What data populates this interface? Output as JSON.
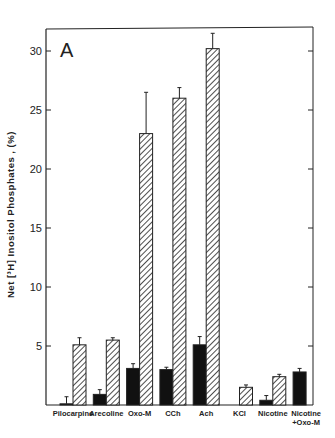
{
  "chart_data": {
    "type": "bar",
    "title": "",
    "panel_label": "A",
    "xlabel": "",
    "ylabel": "Net [3H] Inositol Phosphates , (%)",
    "ylim": [
      0,
      31.5
    ],
    "yticks": [
      5,
      10,
      15,
      20,
      25,
      30
    ],
    "grid": false,
    "legend": null,
    "categories": [
      "Pilocarpine",
      "Arecoline",
      "Oxo-M",
      "CCh",
      "Ach",
      "KCl",
      "Nicotine",
      "Nicotine + Oxo-M"
    ],
    "series": [
      {
        "name": "black (solid)",
        "fill": "#111111",
        "values": [
          0.1,
          0.9,
          3.1,
          3.0,
          5.1,
          0.0,
          0.4,
          2.8
        ],
        "errors": [
          0.6,
          0.4,
          0.4,
          0.2,
          0.7,
          0.0,
          0.4,
          0.3
        ]
      },
      {
        "name": "hatched",
        "fill": "hatch",
        "values": [
          5.1,
          5.5,
          23.0,
          26.0,
          30.2,
          1.5,
          2.4,
          null
        ],
        "errors": [
          0.6,
          0.2,
          3.5,
          0.9,
          1.3,
          0.2,
          0.2,
          null
        ]
      }
    ]
  },
  "labels": {
    "panel": "A",
    "ylabel_parts": [
      "Net",
      "[",
      "3",
      "H",
      "]",
      "Inositol",
      "Phosphates",
      ",",
      "(%)"
    ],
    "ylabel": "Net [³H] Inositol Phosphates , (%)",
    "categories_line1": [
      "Pilocarpine",
      "Arecoline",
      "Oxo-M",
      "CCh",
      "Ach",
      "KCl",
      "Nicotine",
      "Nicotine"
    ],
    "categories_line2": [
      "",
      "",
      "",
      "",
      "",
      "",
      "",
      "+Oxo-M"
    ],
    "yticks": [
      "5",
      "10",
      "15",
      "20",
      "25",
      "30"
    ]
  }
}
